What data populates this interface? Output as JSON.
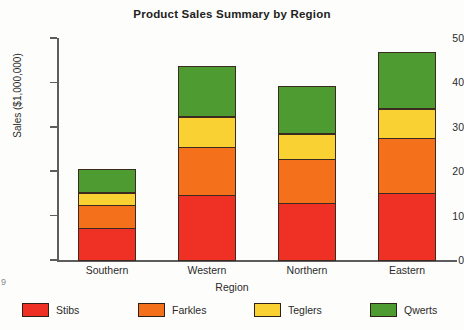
{
  "chart_data": {
    "type": "bar",
    "subtype": "stacked-bar",
    "title": "Product Sales Summary by Region",
    "xlabel": "Region",
    "ylabel": "Sales ($1,000,000)",
    "categories": [
      "Southern",
      "Western",
      "Northern",
      "Eastern"
    ],
    "series": [
      {
        "name": "Stibs",
        "color": "#ee3124",
        "values": [
          7.4,
          14.9,
          13.1,
          15.3
        ]
      },
      {
        "name": "Farkles",
        "color": "#f4701b",
        "values": [
          5.4,
          11.0,
          10.1,
          12.6
        ]
      },
      {
        "name": "Teglers",
        "color": "#fad132",
        "values": [
          3.0,
          7.0,
          5.9,
          6.8
        ]
      },
      {
        "name": "Qwerts",
        "color": "#4d9b31",
        "values": [
          5.4,
          11.5,
          10.8,
          12.8
        ]
      }
    ],
    "totals": [
      21.2,
      44.4,
      39.9,
      47.5
    ],
    "ylim": [
      0,
      50
    ],
    "yticks": [
      0,
      10,
      20,
      30,
      40,
      50
    ],
    "ytick_labels": [
      "0",
      "10",
      "20",
      "30",
      "40",
      "50"
    ],
    "grid": false,
    "legend_position": "bottom",
    "legend_entries": [
      "Stibs",
      "Farkles",
      "Teglers",
      "Qwerts"
    ]
  },
  "artifact": {
    "edge_mark": "9"
  }
}
